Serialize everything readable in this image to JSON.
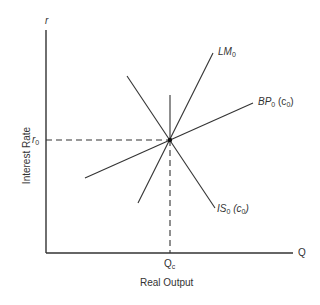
{
  "diagram": {
    "type": "IS-LM-BP equilibrium diagram",
    "axes": {
      "y_axis_symbol": "r",
      "y_axis_label": "Interest Rate",
      "x_axis_symbol": "Q",
      "x_axis_label": "Real Output"
    },
    "equilibrium": {
      "r_label_base": "r",
      "r_label_sub": "0",
      "q_label_base": "Q",
      "q_label_sub": "c"
    },
    "curves": [
      {
        "id": "LM",
        "label_base": "LM",
        "label_sub": "0",
        "label_suffix": ""
      },
      {
        "id": "BP",
        "label_base": "BP",
        "label_sub": "0",
        "label_suffix": "(c",
        "label_suffix_sub": "0",
        "label_suffix_end": ")"
      },
      {
        "id": "IS",
        "label_base": "IS",
        "label_sub": "0",
        "label_suffix": "(c",
        "label_suffix_sub": "0",
        "label_suffix_end": ")"
      }
    ],
    "colors": {
      "line": "#333333",
      "background": "#ffffff"
    }
  }
}
